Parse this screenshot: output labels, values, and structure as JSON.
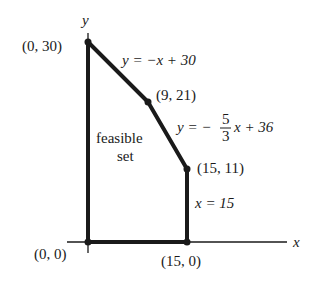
{
  "diagram": {
    "axes": {
      "x_label": "x",
      "y_label": "y"
    },
    "vertices": [
      {
        "id": "v0",
        "label": "(0, 0)",
        "x": 0,
        "y": 0
      },
      {
        "id": "v1",
        "label": "(0, 30)",
        "x": 0,
        "y": 30
      },
      {
        "id": "v2",
        "label": "(9, 21)",
        "x": 9,
        "y": 21
      },
      {
        "id": "v3",
        "label": "(15, 11)",
        "x": 15,
        "y": 11
      },
      {
        "id": "v4",
        "label": "(15, 0)",
        "x": 15,
        "y": 0
      }
    ],
    "constraints": [
      {
        "label_pre": "y = −x + 30"
      },
      {
        "label_pre": "y = −",
        "frac_num": "5",
        "frac_den": "3",
        "label_post": "x + 36"
      },
      {
        "label_pre": "x = 15"
      }
    ],
    "region": {
      "line1": "feasible",
      "line2": "set"
    },
    "colors": {
      "line": "#1a1a1a",
      "background": "#ffffff"
    }
  }
}
